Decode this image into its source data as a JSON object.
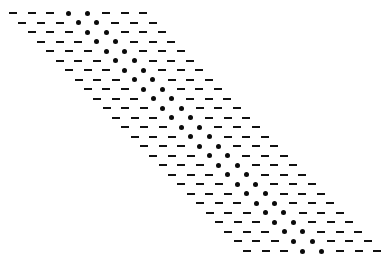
{
  "pattern": {
    "description": "Sheared lattice of rows, each row: 3 dashes, 2 dots, 3 dashes",
    "rows": 26,
    "row_layout": [
      "dash",
      "dash",
      "dash",
      "dot",
      "dot",
      "dash",
      "dash",
      "dash"
    ],
    "first_row": {
      "x": 13,
      "y": 13
    },
    "element_spacing_x": 18.6,
    "row_spacing_y": 9.52,
    "row_shift_x": 9.36,
    "colors": {
      "background": "#ffffff",
      "mark": "#111111"
    }
  }
}
